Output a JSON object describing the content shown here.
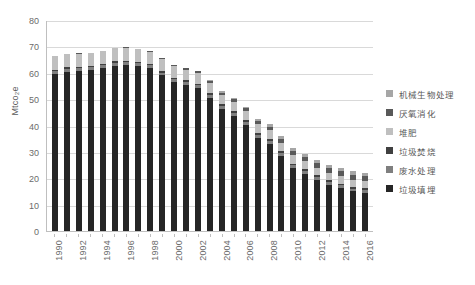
{
  "chart_data": {
    "type": "bar",
    "subtype": "stacked-bar",
    "title": "",
    "xlabel": "",
    "ylabel": "Mtco₂e",
    "ylim": [
      0,
      80
    ],
    "yticks": [
      0,
      10,
      20,
      30,
      40,
      50,
      60,
      70,
      80
    ],
    "grid": true,
    "legend_position": "right",
    "x_tick_label_rotation": -90,
    "categories": [
      "1990",
      "1991",
      "1992",
      "1993",
      "1994",
      "1995",
      "1996",
      "1997",
      "1998",
      "1999",
      "2000",
      "2001",
      "2002",
      "2003",
      "2004",
      "2005",
      "2006",
      "2007",
      "2008",
      "2009",
      "2010",
      "2011",
      "2012",
      "2013",
      "2014",
      "2015",
      "2016"
    ],
    "x_tick_labels_shown": [
      "1990",
      "1992",
      "1994",
      "1996",
      "1998",
      "2000",
      "2002",
      "2004",
      "2006",
      "2008",
      "2010",
      "2012",
      "2014",
      "2016"
    ],
    "series": [
      {
        "name": "垃圾填埋",
        "color": "#262626",
        "values": [
          59.4,
          60.4,
          60.6,
          61.0,
          61.7,
          62.7,
          62.9,
          62.5,
          61.8,
          59.0,
          56.4,
          55.3,
          54.1,
          50.4,
          46.2,
          43.6,
          40.2,
          35.4,
          33.1,
          28.4,
          23.8,
          21.7,
          19.3,
          17.4,
          16.2,
          15.0,
          14.4
        ]
      },
      {
        "name": "废水处理",
        "color": "#7f7f7f",
        "values": [
          1.1,
          1.1,
          1.1,
          1.1,
          1.1,
          1.1,
          1.1,
          1.1,
          1.1,
          1.1,
          1.1,
          1.1,
          1.1,
          1.1,
          1.1,
          1.1,
          1.1,
          1.1,
          1.1,
          1.1,
          1.1,
          1.1,
          1.1,
          1.1,
          1.1,
          1.1,
          1.1
        ]
      },
      {
        "name": "垃圾焚烧",
        "color": "#404040",
        "values": [
          0.6,
          0.6,
          0.6,
          0.6,
          0.6,
          0.6,
          0.6,
          0.6,
          0.6,
          0.7,
          0.7,
          0.7,
          0.7,
          0.7,
          0.7,
          0.7,
          0.7,
          0.7,
          0.7,
          0.7,
          0.7,
          0.7,
          0.7,
          0.7,
          0.7,
          0.7,
          0.7
        ]
      },
      {
        "name": "堆肥",
        "color": "#bfbfbf",
        "values": [
          5.1,
          5.0,
          5.0,
          4.8,
          4.8,
          4.9,
          4.9,
          4.8,
          4.5,
          4.4,
          4.2,
          4.1,
          4.0,
          3.9,
          3.7,
          3.6,
          3.5,
          3.4,
          3.3,
          3.2,
          3.1,
          3.0,
          2.9,
          2.8,
          2.7,
          2.6,
          2.6
        ]
      },
      {
        "name": "厌氧消化",
        "color": "#595959",
        "values": [
          0.1,
          0.1,
          0.1,
          0.1,
          0.1,
          0.1,
          0.1,
          0.2,
          0.2,
          0.3,
          0.4,
          0.5,
          0.6,
          0.7,
          0.8,
          0.9,
          1.0,
          1.2,
          1.3,
          1.5,
          1.6,
          1.7,
          1.8,
          1.8,
          1.9,
          1.9,
          2.0
        ]
      },
      {
        "name": "机械生物处理",
        "color": "#a6a6a6",
        "values": [
          0.0,
          0.0,
          0.0,
          0.0,
          0.0,
          0.0,
          0.0,
          0.0,
          0.0,
          0.1,
          0.1,
          0.2,
          0.3,
          0.4,
          0.5,
          0.6,
          0.7,
          0.8,
          0.9,
          1.0,
          1.1,
          1.2,
          1.3,
          1.3,
          1.3,
          1.3,
          1.3
        ]
      }
    ],
    "totals": [
      66.3,
      67.2,
      67.4,
      67.6,
      68.3,
      69.4,
      69.6,
      69.2,
      68.2,
      65.6,
      62.9,
      61.9,
      60.8,
      57.2,
      53.0,
      50.5,
      47.2,
      42.6,
      40.4,
      35.9,
      31.4,
      29.4,
      27.1,
      25.1,
      23.9,
      22.6,
      22.1
    ]
  },
  "legend": {
    "items": [
      {
        "label": "机械生物处理",
        "color": "#a6a6a6"
      },
      {
        "label": "厌氧消化",
        "color": "#595959"
      },
      {
        "label": "堆肥",
        "color": "#bfbfbf"
      },
      {
        "label": "垃圾焚烧",
        "color": "#404040"
      },
      {
        "label": "废水处理",
        "color": "#7f7f7f"
      },
      {
        "label": "垃圾填埋",
        "color": "#262626"
      }
    ]
  },
  "caption": {
    "text": ""
  }
}
